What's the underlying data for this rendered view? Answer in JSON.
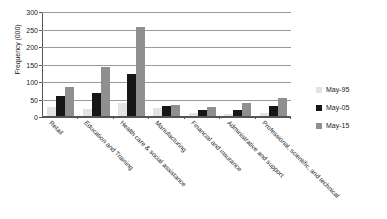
{
  "chart_data": {
    "type": "bar",
    "title": "",
    "xlabel": "",
    "ylabel": "Frequency (000)",
    "ylim": [
      0,
      300
    ],
    "yticks": [
      0,
      50,
      100,
      150,
      200,
      250,
      300
    ],
    "grid": true,
    "legend_position": "right",
    "categories": [
      "Retail",
      "Education and Training",
      "Health care & social assistance",
      "Manufacturing",
      "Financial and insurance",
      "Administrative and support",
      "Professional, scientific, and technical"
    ],
    "series": [
      {
        "name": "May-95",
        "color": "#e3e3e3",
        "values": [
          26,
          20,
          36,
          22,
          8,
          5,
          8
        ]
      },
      {
        "name": "May-05",
        "color": "#161616",
        "values": [
          58,
          67,
          120,
          30,
          17,
          18,
          30
        ]
      },
      {
        "name": "May-15",
        "color": "#8f8f8f",
        "values": [
          82,
          141,
          253,
          32,
          27,
          37,
          52
        ]
      }
    ]
  }
}
